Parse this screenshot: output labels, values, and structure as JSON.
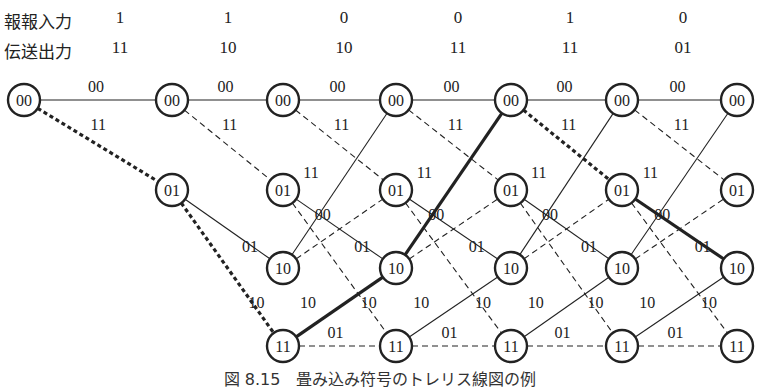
{
  "header": {
    "input_row_label": "報報入力",
    "output_row_label": "伝送出力",
    "inputs": [
      "1",
      "1",
      "0",
      "0",
      "1",
      "0"
    ],
    "outputs": [
      "11",
      "10",
      "10",
      "11",
      "11",
      "01"
    ]
  },
  "trellis": {
    "states": [
      "00",
      "01",
      "10",
      "11"
    ],
    "legend": {
      "solid": "input 0",
      "dashed": "input 1"
    },
    "transitions": {
      "00": {
        "input0": {
          "to": "00",
          "out": "00"
        },
        "input1": {
          "to": "01",
          "out": "11"
        }
      },
      "01": {
        "input0": {
          "to": "10",
          "out": "01"
        },
        "input1": {
          "to": "11",
          "out": "10"
        }
      },
      "10": {
        "input0": {
          "to": "00",
          "out": "11"
        },
        "input1": {
          "to": "01",
          "out": "00"
        }
      },
      "11": {
        "input0": {
          "to": "10",
          "out": "10"
        },
        "input1": {
          "to": "11",
          "out": "01"
        }
      }
    },
    "time_steps": 7,
    "highlighted_path": [
      "00",
      "01",
      "11",
      "10",
      "00",
      "01",
      "10"
    ]
  },
  "caption": "図 8.15　畳み込み符号のトレリス線図の例"
}
